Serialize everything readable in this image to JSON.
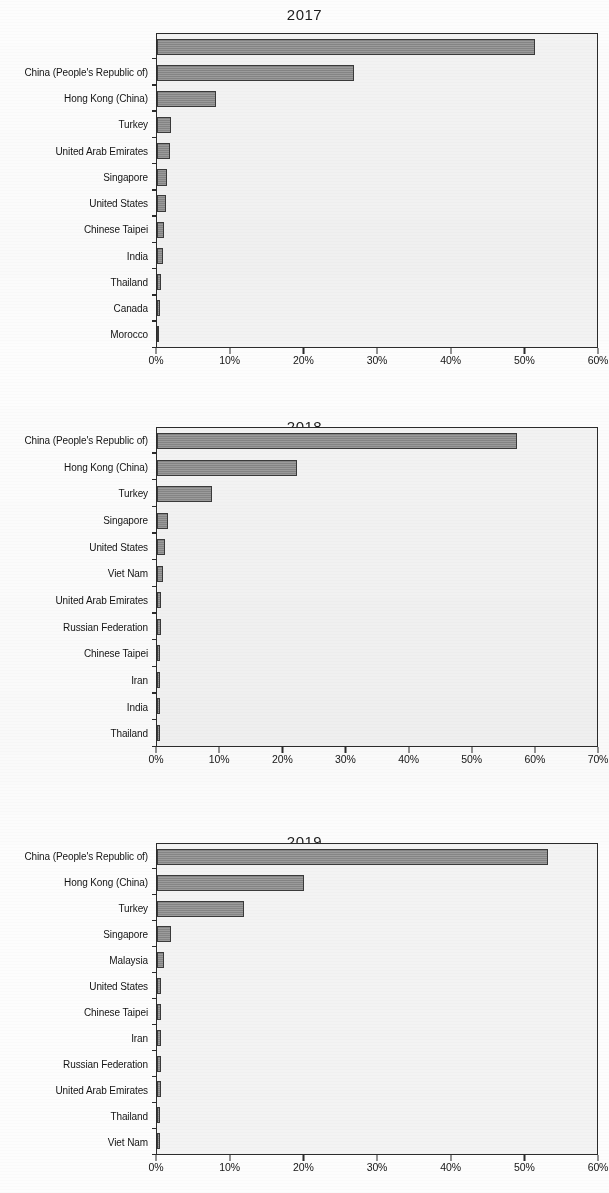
{
  "document": {
    "background_color": "#fdfdfd",
    "bar_color": "#8c8c8c",
    "bar_border_color": "#3a3a3a",
    "plot_background_color": "#f3f3f3",
    "axis_color": "#2b2b2b"
  },
  "chart_data": [
    {
      "type": "bar",
      "orientation": "horizontal",
      "title": "2017",
      "xlabel": "",
      "ylabel": "",
      "xlim": [
        0,
        60
      ],
      "xticks": [
        0,
        10,
        20,
        30,
        40,
        50,
        60
      ],
      "xticklabels": [
        "0%",
        "10%",
        "20%",
        "30%",
        "40%",
        "50%",
        "60%"
      ],
      "grid": false,
      "legend": null,
      "categories": [
        "",
        "China (People's Republic of)",
        "Hong Kong (China)",
        "Turkey",
        "United Arab Emirates",
        "Singapore",
        "United States",
        "Chinese Taipei",
        "India",
        "Thailand",
        "Canada",
        "Morocco"
      ],
      "values": [
        51.5,
        26.8,
        8.0,
        1.9,
        1.8,
        1.3,
        1.2,
        1.0,
        0.8,
        0.5,
        0.4,
        0.3
      ]
    },
    {
      "type": "bar",
      "orientation": "horizontal",
      "title": "2018",
      "xlabel": "",
      "ylabel": "",
      "xlim": [
        0,
        70
      ],
      "xticks": [
        0,
        10,
        20,
        30,
        40,
        50,
        60,
        70
      ],
      "xticklabels": [
        "0%",
        "10%",
        "20%",
        "30%",
        "40%",
        "50%",
        "60%",
        "70%"
      ],
      "grid": false,
      "legend": null,
      "categories": [
        "China (People's Republic of)",
        "Hong Kong (China)",
        "Turkey",
        "Singapore",
        "United States",
        "Viet Nam",
        "United Arab Emirates",
        "Russian Federation",
        "Chinese Taipei",
        "Iran",
        "India",
        "Thailand"
      ],
      "values": [
        57.2,
        22.2,
        8.7,
        1.7,
        1.2,
        1.0,
        0.6,
        0.6,
        0.5,
        0.5,
        0.4,
        0.4
      ]
    },
    {
      "type": "bar",
      "orientation": "horizontal",
      "title": "2019",
      "xlabel": "",
      "ylabel": "",
      "xlim": [
        0,
        60
      ],
      "xticks": [
        0,
        10,
        20,
        30,
        40,
        50,
        60
      ],
      "xticklabels": [
        "0%",
        "10%",
        "20%",
        "30%",
        "40%",
        "50%",
        "60%"
      ],
      "grid": false,
      "legend": null,
      "categories": [
        "China (People's Republic of)",
        "Hong Kong (China)",
        "Turkey",
        "Singapore",
        "Malaysia",
        "United States",
        "Chinese Taipei",
        "Iran",
        "Russian Federation",
        "United Arab Emirates",
        "Thailand",
        "Viet Nam"
      ],
      "values": [
        53.3,
        20.1,
        11.9,
        1.9,
        1.0,
        0.6,
        0.6,
        0.5,
        0.5,
        0.5,
        0.4,
        0.4
      ]
    }
  ]
}
